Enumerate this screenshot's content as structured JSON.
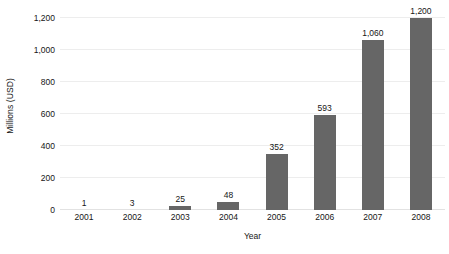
{
  "chart_data": {
    "type": "bar",
    "title": "",
    "subtitle": "",
    "xlabel": "Year",
    "ylabel": "Millions (USD)",
    "categories": [
      "2001",
      "2002",
      "2003",
      "2004",
      "2005",
      "2006",
      "2007",
      "2008"
    ],
    "values": [
      1,
      3,
      25,
      48,
      352,
      593,
      1060,
      1200
    ],
    "value_labels": [
      "1",
      "3",
      "25",
      "48",
      "352",
      "593",
      "1,060",
      "1,200"
    ],
    "ylim": [
      0,
      1200
    ],
    "ytick_values": [
      0,
      200,
      400,
      600,
      800,
      1000,
      1200
    ],
    "ytick_labels": [
      "0",
      "200",
      "400",
      "600",
      "800",
      "1,000",
      "1,200"
    ],
    "grid": "horizontal",
    "legend": "none",
    "bar_color": "#666666",
    "gridline_color": "#ededed",
    "background_color": "#ffffff",
    "text_color": "#161616"
  }
}
